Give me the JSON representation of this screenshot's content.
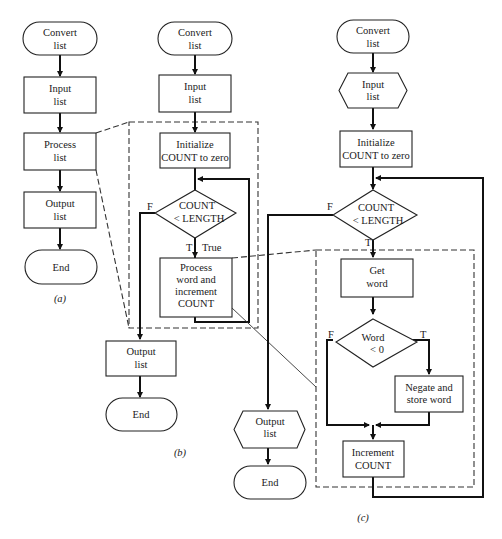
{
  "figure_a": {
    "caption": "(a)",
    "nodes": [
      {
        "id": "a-start",
        "type": "terminal",
        "lines": [
          "Convert",
          "list"
        ]
      },
      {
        "id": "a-input",
        "type": "process",
        "lines": [
          "Input",
          "list"
        ]
      },
      {
        "id": "a-process",
        "type": "process",
        "lines": [
          "Process",
          "list"
        ]
      },
      {
        "id": "a-output",
        "type": "process",
        "lines": [
          "Output",
          "list"
        ]
      },
      {
        "id": "a-end",
        "type": "terminal",
        "lines": [
          "End"
        ]
      }
    ]
  },
  "figure_b": {
    "caption": "(b)",
    "nodes": [
      {
        "id": "b-start",
        "type": "terminal",
        "lines": [
          "Convert",
          "list"
        ]
      },
      {
        "id": "b-input",
        "type": "process",
        "lines": [
          "Input",
          "list"
        ]
      },
      {
        "id": "b-init",
        "type": "process",
        "lines": [
          "Initialize",
          "COUNT to zero"
        ]
      },
      {
        "id": "b-decision",
        "type": "decision",
        "lines": [
          "COUNT",
          "< LENGTH"
        ]
      },
      {
        "id": "b-process",
        "type": "process",
        "lines": [
          "Process",
          "word and",
          "increment",
          "COUNT"
        ]
      },
      {
        "id": "b-output",
        "type": "process",
        "lines": [
          "Output",
          "list"
        ]
      },
      {
        "id": "b-end",
        "type": "terminal",
        "lines": [
          "End"
        ]
      }
    ],
    "branch_labels": {
      "false": "F",
      "true": "T",
      "true_word": "True"
    }
  },
  "figure_c": {
    "caption": "(c)",
    "nodes": [
      {
        "id": "c-start",
        "type": "terminal",
        "lines": [
          "Convert",
          "list"
        ]
      },
      {
        "id": "c-input",
        "type": "io-hexagon",
        "lines": [
          "Input",
          "list"
        ]
      },
      {
        "id": "c-init",
        "type": "process",
        "lines": [
          "Initialize",
          "COUNT to zero"
        ]
      },
      {
        "id": "c-decision",
        "type": "decision",
        "lines": [
          "COUNT",
          "< LENGTH"
        ]
      },
      {
        "id": "c-get",
        "type": "process",
        "lines": [
          "Get",
          "word"
        ]
      },
      {
        "id": "c-word-decision",
        "type": "decision",
        "lines": [
          "Word",
          "< 0"
        ]
      },
      {
        "id": "c-negate",
        "type": "process",
        "lines": [
          "Negate and",
          "store word"
        ]
      },
      {
        "id": "c-increment",
        "type": "process",
        "lines": [
          "Increment",
          "COUNT"
        ]
      },
      {
        "id": "c-output",
        "type": "io-hexagon",
        "lines": [
          "Output",
          "list"
        ]
      },
      {
        "id": "c-end",
        "type": "terminal",
        "lines": [
          "End"
        ]
      }
    ],
    "branch_labels": {
      "count_false": "F",
      "count_true": "T",
      "word_false": "F",
      "word_true": "T"
    }
  },
  "colors": {
    "line": "#111111",
    "background": "#ffffff"
  }
}
